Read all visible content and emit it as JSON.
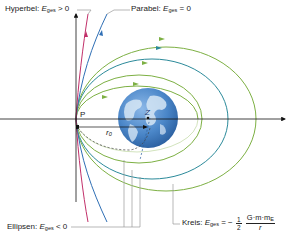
{
  "labels": {
    "hyperbola": {
      "name": "Hyperbel:",
      "var": "E",
      "sub": "ges",
      "rel": "> 0"
    },
    "parabola": {
      "name": "Parabel:",
      "var": "E",
      "sub": "ges",
      "rel": "= 0"
    },
    "ellipses": {
      "name": "Ellipsen:",
      "var": "E",
      "sub": "ges",
      "rel": "< 0"
    },
    "circle": {
      "name": "Kreis:",
      "var": "E",
      "sub": "ges",
      "rel": "= −",
      "half_num": "1",
      "half_den": "2",
      "frac_num": "G·m·m",
      "frac_num_sub": "E",
      "frac_den": "r"
    },
    "point_p": "P",
    "point_z": "Z",
    "radius": "r",
    "radius_sub": "0"
  },
  "colors": {
    "hyperbola": "#c2306a",
    "parabola": "#2f6fb5",
    "ellipse_green": "#7db043",
    "ellipse_teal": "#2b8a9a",
    "axis": "#111111",
    "leader": "#9a9a9a",
    "earth_ocean": "#4a86c8",
    "earth_land": "#c9dcef"
  }
}
